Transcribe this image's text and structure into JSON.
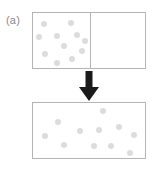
{
  "figure": {
    "panel_label": "(a)",
    "width": 155,
    "height": 170,
    "background_color": "#ffffff"
  },
  "colors": {
    "box_border": "#b4b4b4",
    "divider": "#b4b4b4",
    "particle": "#dcdcdc",
    "arrow": "#1a1a1a",
    "label_text": "#8a8a8a"
  },
  "boxes": {
    "top": {
      "name": "divided-container",
      "x": 32,
      "y": 12,
      "width": 114,
      "height": 57,
      "divider_x": 57,
      "left_chamber_filled": true,
      "right_chamber_filled": false,
      "particle_count": 11
    },
    "bottom": {
      "name": "expanded-container",
      "x": 32,
      "y": 102,
      "width": 114,
      "height": 57,
      "divider_x": null,
      "particle_count": 11
    }
  },
  "particles": {
    "radius": 3.2,
    "top_box": [
      {
        "cx": 11,
        "cy": 11
      },
      {
        "cx": 38,
        "cy": 10
      },
      {
        "cx": 6,
        "cy": 24
      },
      {
        "cx": 24,
        "cy": 23
      },
      {
        "cx": 44,
        "cy": 22
      },
      {
        "cx": 31,
        "cy": 33
      },
      {
        "cx": 12,
        "cy": 41
      },
      {
        "cx": 49,
        "cy": 38
      },
      {
        "cx": 39,
        "cy": 46
      },
      {
        "cx": 24,
        "cy": 50
      },
      {
        "cx": 52,
        "cy": 28
      }
    ],
    "bottom_box": [
      {
        "cx": 70,
        "cy": 8
      },
      {
        "cx": 25,
        "cy": 19
      },
      {
        "cx": 47,
        "cy": 28
      },
      {
        "cx": 66,
        "cy": 27
      },
      {
        "cx": 86,
        "cy": 24
      },
      {
        "cx": 101,
        "cy": 32
      },
      {
        "cx": 31,
        "cy": 42
      },
      {
        "cx": 61,
        "cy": 43
      },
      {
        "cx": 78,
        "cy": 43
      },
      {
        "cx": 97,
        "cy": 50
      },
      {
        "cx": 12,
        "cy": 33
      }
    ]
  },
  "arrow": {
    "name": "downward-transition-arrow",
    "direction": "down",
    "x": 78,
    "y": 71,
    "width": 22,
    "height": 30
  }
}
